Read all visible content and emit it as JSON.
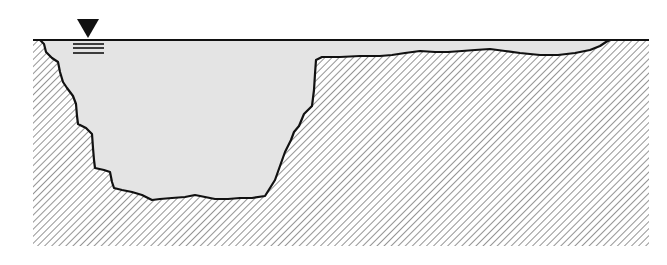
{
  "figure": {
    "title": "",
    "colors": {
      "background": "#ffffff",
      "water": "#e4e4e4",
      "outline": "#111111",
      "hatch": "#7a7a7a",
      "symbol": "#111111"
    },
    "water_level_symbol": {
      "icon": "water-level-triangle-icon",
      "triangle": {
        "x_left": 77,
        "x_right": 99,
        "y_top": 19,
        "apex_y": 38
      },
      "lines_y": [
        44,
        48,
        53
      ],
      "lines_x": [
        73,
        104
      ]
    },
    "water_surface": {
      "y": 40,
      "x_start": 33,
      "x_end": 649
    },
    "ground_extent": {
      "x_left": 33,
      "x_right": 649,
      "y_bottom": 246
    },
    "bed_profile": [
      [
        33,
        40
      ],
      [
        40,
        40
      ],
      [
        44,
        44
      ],
      [
        46,
        52
      ],
      [
        52,
        58
      ],
      [
        58,
        62
      ],
      [
        60,
        72
      ],
      [
        63,
        82
      ],
      [
        67,
        88
      ],
      [
        73,
        96
      ],
      [
        76,
        104
      ],
      [
        77,
        116
      ],
      [
        78,
        124
      ],
      [
        86,
        128
      ],
      [
        92,
        134
      ],
      [
        93,
        148
      ],
      [
        94,
        160
      ],
      [
        95,
        168
      ],
      [
        104,
        170
      ],
      [
        110,
        172
      ],
      [
        112,
        182
      ],
      [
        114,
        188
      ],
      [
        122,
        190
      ],
      [
        132,
        192
      ],
      [
        142,
        195
      ],
      [
        152,
        200
      ],
      [
        160,
        199
      ],
      [
        172,
        198
      ],
      [
        185,
        197
      ],
      [
        195,
        195
      ],
      [
        205,
        197
      ],
      [
        215,
        199
      ],
      [
        228,
        199
      ],
      [
        240,
        198
      ],
      [
        252,
        198
      ],
      [
        265,
        196
      ],
      [
        270,
        188
      ],
      [
        275,
        180
      ],
      [
        280,
        166
      ],
      [
        285,
        152
      ],
      [
        291,
        140
      ],
      [
        294,
        132
      ],
      [
        299,
        126
      ],
      [
        304,
        114
      ],
      [
        308,
        110
      ],
      [
        312,
        106
      ],
      [
        314,
        90
      ],
      [
        315,
        74
      ],
      [
        316,
        60
      ],
      [
        322,
        57
      ],
      [
        340,
        57
      ],
      [
        360,
        56
      ],
      [
        380,
        56
      ],
      [
        392,
        55
      ],
      [
        405,
        53
      ],
      [
        420,
        51
      ],
      [
        435,
        52
      ],
      [
        448,
        52
      ],
      [
        462,
        51
      ],
      [
        475,
        50
      ],
      [
        490,
        49
      ],
      [
        505,
        51
      ],
      [
        520,
        53
      ],
      [
        540,
        55
      ],
      [
        558,
        55
      ],
      [
        575,
        53
      ],
      [
        590,
        50
      ],
      [
        600,
        46
      ],
      [
        606,
        42
      ],
      [
        610,
        40
      ]
    ]
  }
}
